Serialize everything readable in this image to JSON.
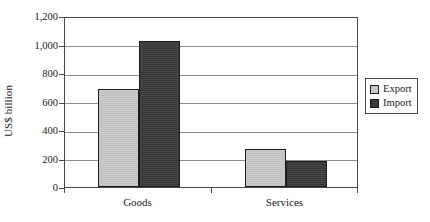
{
  "chart_data": {
    "type": "bar",
    "title": "",
    "subtitle": "",
    "xlabel": "",
    "ylabel": "US$ billion",
    "categories": [
      "Goods",
      "Services"
    ],
    "series": [
      {
        "name": "Export",
        "values": [
          685,
          265
        ],
        "color": "#c9c9c9"
      },
      {
        "name": "Import",
        "values": [
          1025,
          180
        ],
        "color": "#3b3b3b"
      }
    ],
    "ylim": [
      0,
      1200
    ],
    "ytick_values": [
      0,
      200,
      400,
      600,
      800,
      1000,
      1200
    ],
    "ytick_labels": [
      "0",
      "200",
      "400",
      "600",
      "800",
      "1,000",
      "1,200"
    ],
    "grid": "horizontal",
    "legend_position": "right-outside",
    "legend_entries": [
      "Export",
      "Import"
    ],
    "annotations": []
  },
  "legend": {
    "items": [
      {
        "label": "Export",
        "swatch": "legend-swatch-export"
      },
      {
        "label": "Import",
        "swatch": "legend-swatch-import"
      }
    ]
  },
  "axis": {
    "y_title": "US$ billion",
    "y_labels": [
      "1,200",
      "1,000",
      "800",
      "600",
      "400",
      "200",
      "0"
    ],
    "x_labels": [
      "Goods",
      "Services"
    ]
  }
}
